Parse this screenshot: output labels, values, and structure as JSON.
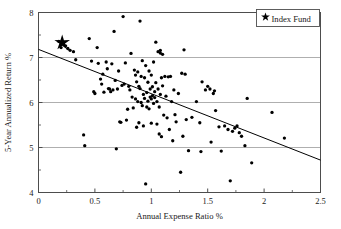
{
  "chart_data": {
    "type": "scatter",
    "title": "",
    "xlabel": "Annual Expense Ratio %",
    "ylabel": "5-Year Annualized Return %",
    "xlim": [
      0,
      2.5
    ],
    "ylim": [
      4,
      8
    ],
    "xticks": [
      0,
      0.5,
      1,
      1.5,
      2,
      2.5
    ],
    "xtick_labels": [
      "0",
      "0.5",
      "1",
      "1.5",
      "2",
      "2.5"
    ],
    "yticks": [
      4,
      5,
      6,
      7,
      8
    ],
    "ytick_labels": [
      "4",
      "5",
      "6",
      "7",
      "8"
    ],
    "xminor_ticks": [
      0.25,
      0.75,
      1.25,
      1.75,
      2.25
    ],
    "yminor_ticks": [
      4.5,
      5.5,
      6.5,
      7.5
    ],
    "grid": "horizontal-major",
    "gridlines_y": [
      5,
      6,
      7
    ],
    "legend": {
      "position": "top-right",
      "entries": [
        {
          "label": "Index Fund",
          "marker": "star",
          "color": "#000000"
        }
      ]
    },
    "series": [
      {
        "name": "Mutual Funds",
        "marker": "dot",
        "color": "#000000",
        "points": [
          [
            0.18,
            7.36
          ],
          [
            0.21,
            7.31
          ],
          [
            0.24,
            7.26
          ],
          [
            0.2,
            7.22
          ],
          [
            0.26,
            7.2
          ],
          [
            0.28,
            7.16
          ],
          [
            0.31,
            7.13
          ],
          [
            0.33,
            6.95
          ],
          [
            0.4,
            5.28
          ],
          [
            0.41,
            5.04
          ],
          [
            0.45,
            7.42
          ],
          [
            0.47,
            6.92
          ],
          [
            0.49,
            6.24
          ],
          [
            0.5,
            6.2
          ],
          [
            0.52,
            7.22
          ],
          [
            0.53,
            6.87
          ],
          [
            0.55,
            6.52
          ],
          [
            0.56,
            6.41
          ],
          [
            0.57,
            6.63
          ],
          [
            0.58,
            6.23
          ],
          [
            0.6,
            6.9
          ],
          [
            0.61,
            6.75
          ],
          [
            0.62,
            6.31
          ],
          [
            0.63,
            6.3
          ],
          [
            0.64,
            6.24
          ],
          [
            0.65,
            6.86
          ],
          [
            0.66,
            6.28
          ],
          [
            0.67,
            7.58
          ],
          [
            0.68,
            6.49
          ],
          [
            0.69,
            4.97
          ],
          [
            0.7,
            6.3
          ],
          [
            0.71,
            6.7
          ],
          [
            0.72,
            5.57
          ],
          [
            0.73,
            5.56
          ],
          [
            0.74,
            6.38
          ],
          [
            0.75,
            7.91
          ],
          [
            0.76,
            6.41
          ],
          [
            0.77,
            6.88
          ],
          [
            0.78,
            5.61
          ],
          [
            0.79,
            5.85
          ],
          [
            0.8,
            6.36
          ],
          [
            0.81,
            6.28
          ],
          [
            0.82,
            7.09
          ],
          [
            0.83,
            6.12
          ],
          [
            0.84,
            5.88
          ],
          [
            0.85,
            6.72
          ],
          [
            0.86,
            6.61
          ],
          [
            0.86,
            6.08
          ],
          [
            0.87,
            6.46
          ],
          [
            0.87,
            5.45
          ],
          [
            0.88,
            6.02
          ],
          [
            0.88,
            6.68
          ],
          [
            0.89,
            6.36
          ],
          [
            0.89,
            5.55
          ],
          [
            0.9,
            7.81
          ],
          [
            0.9,
            6.31
          ],
          [
            0.91,
            6.0
          ],
          [
            0.91,
            6.58
          ],
          [
            0.92,
            6.93
          ],
          [
            0.92,
            5.93
          ],
          [
            0.93,
            6.18
          ],
          [
            0.93,
            5.48
          ],
          [
            0.94,
            6.55
          ],
          [
            0.94,
            6.09
          ],
          [
            0.95,
            4.19
          ],
          [
            0.95,
            6.82
          ],
          [
            0.96,
            6.22
          ],
          [
            0.96,
            5.9
          ],
          [
            0.97,
            6.45
          ],
          [
            0.97,
            6.03
          ],
          [
            0.98,
            6.7
          ],
          [
            0.98,
            5.86
          ],
          [
            0.99,
            6.3
          ],
          [
            0.99,
            6.12
          ],
          [
            1.0,
            6.61
          ],
          [
            1.0,
            6.08
          ],
          [
            1.0,
            5.54
          ],
          [
            1.01,
            6.35
          ],
          [
            1.01,
            6.15
          ],
          [
            1.02,
            6.9
          ],
          [
            1.02,
            5.98
          ],
          [
            1.03,
            6.24
          ],
          [
            1.03,
            6.11
          ],
          [
            1.04,
            7.34
          ],
          [
            1.04,
            6.44
          ],
          [
            1.05,
            6.02
          ],
          [
            1.05,
            5.52
          ],
          [
            1.06,
            7.13
          ],
          [
            1.06,
            6.3
          ],
          [
            1.07,
            5.9
          ],
          [
            1.07,
            5.3
          ],
          [
            1.08,
            7.16
          ],
          [
            1.08,
            7.1
          ],
          [
            1.08,
            6.18
          ],
          [
            1.09,
            5.24
          ],
          [
            1.09,
            6.55
          ],
          [
            1.1,
            7.07
          ],
          [
            1.1,
            6.37
          ],
          [
            1.11,
            5.72
          ],
          [
            1.12,
            6.58
          ],
          [
            1.13,
            6.14
          ],
          [
            1.14,
            5.66
          ],
          [
            1.15,
            6.57
          ],
          [
            1.16,
            5.4
          ],
          [
            1.17,
            6.58
          ],
          [
            1.18,
            6.02
          ],
          [
            1.19,
            5.15
          ],
          [
            1.2,
            6.28
          ],
          [
            1.21,
            5.73
          ],
          [
            1.22,
            5.57
          ],
          [
            1.24,
            6.2
          ],
          [
            1.26,
            4.45
          ],
          [
            1.27,
            6.65
          ],
          [
            1.28,
            5.25
          ],
          [
            1.29,
            7.17
          ],
          [
            1.3,
            6.63
          ],
          [
            1.31,
            5.62
          ],
          [
            1.33,
            4.93
          ],
          [
            1.36,
            5.67
          ],
          [
            1.4,
            6.02
          ],
          [
            1.43,
            5.55
          ],
          [
            1.44,
            4.91
          ],
          [
            1.45,
            6.46
          ],
          [
            1.48,
            6.28
          ],
          [
            1.5,
            6.36
          ],
          [
            1.52,
            6.3
          ],
          [
            1.53,
            5.12
          ],
          [
            1.55,
            6.2
          ],
          [
            1.56,
            6.26
          ],
          [
            1.57,
            5.82
          ],
          [
            1.6,
            5.46
          ],
          [
            1.62,
            4.92
          ],
          [
            1.65,
            5.48
          ],
          [
            1.68,
            5.4
          ],
          [
            1.7,
            4.26
          ],
          [
            1.72,
            5.36
          ],
          [
            1.74,
            5.43
          ],
          [
            1.76,
            5.48
          ],
          [
            1.78,
            5.33
          ],
          [
            1.8,
            5.25
          ],
          [
            1.83,
            5.04
          ],
          [
            1.85,
            6.09
          ],
          [
            1.89,
            4.66
          ],
          [
            2.07,
            5.78
          ],
          [
            2.18,
            5.21
          ]
        ]
      }
    ],
    "highlight": {
      "name": "Index Fund",
      "marker": "star",
      "x": 0.21,
      "y": 7.33
    },
    "trendline": {
      "type": "linear",
      "x0": 0.0,
      "y0": 7.18,
      "x1": 2.5,
      "y1": 4.72
    }
  }
}
